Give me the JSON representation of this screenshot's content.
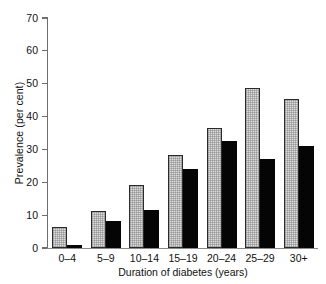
{
  "chart_data": {
    "type": "bar",
    "title": "",
    "xlabel": "Duration of diabetes (years)",
    "ylabel": "Prevalence (per cent)",
    "categories": [
      "0–4",
      "5–9",
      "10–14",
      "15–19",
      "20–24",
      "25–29",
      "30+"
    ],
    "series": [
      {
        "name": "light-grey-series",
        "color": "#dcdcdc",
        "values": [
          6.3,
          11.2,
          19.1,
          28.4,
          36.5,
          48.8,
          45.4
        ]
      },
      {
        "name": "black-series",
        "color": "#050505",
        "values": [
          1.0,
          8.2,
          11.6,
          24.2,
          32.5,
          27.1,
          31.1
        ]
      }
    ],
    "ylim": [
      0,
      70
    ],
    "yticks": [
      0,
      10,
      20,
      30,
      40,
      50,
      60,
      70
    ],
    "ytick_labels": [
      "0",
      "10",
      "20",
      "30",
      "40",
      "50",
      "60",
      "70"
    ],
    "grid": false,
    "legend": "none",
    "legend_position": "none"
  }
}
